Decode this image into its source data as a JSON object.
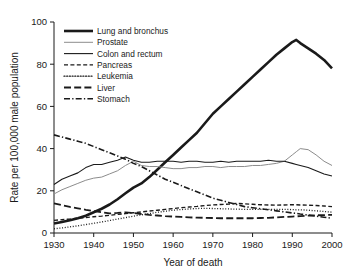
{
  "chart_data": {
    "type": "line",
    "title": "",
    "xlabel": "Year of death",
    "ylabel": "Rate per 100,000 male population",
    "xlim": [
      1930,
      2000
    ],
    "ylim": [
      0,
      100
    ],
    "xticks": [
      1930,
      1940,
      1950,
      1960,
      1970,
      1980,
      1990,
      2000
    ],
    "yticks": [
      0,
      20,
      40,
      60,
      80,
      100
    ],
    "grid": false,
    "legend_position": "upper left",
    "x": [
      1930,
      1932,
      1934,
      1936,
      1938,
      1940,
      1942,
      1944,
      1946,
      1948,
      1950,
      1952,
      1954,
      1956,
      1958,
      1960,
      1962,
      1964,
      1966,
      1968,
      1970,
      1972,
      1974,
      1976,
      1978,
      1980,
      1982,
      1984,
      1986,
      1988,
      1990,
      1991,
      1992,
      1994,
      1996,
      1998,
      2000
    ],
    "series": [
      {
        "name": "Lung and bronchus",
        "style": "solid",
        "width": 2.6,
        "color": "#1a1a1a",
        "values": [
          4.5,
          5.2,
          6.0,
          7.0,
          8.2,
          9.8,
          11.5,
          13.5,
          16.0,
          18.8,
          21.5,
          23.5,
          26.5,
          30.0,
          33.5,
          37.0,
          40.5,
          44.0,
          47.5,
          52.0,
          56.5,
          60.0,
          63.5,
          67.0,
          70.5,
          74.0,
          77.5,
          81.0,
          84.5,
          87.5,
          90.5,
          91.5,
          90.0,
          87.5,
          85.0,
          82.0,
          78.0
        ]
      },
      {
        "name": "Prostate",
        "style": "solid",
        "width": 1.0,
        "color": "#8c8c8c",
        "values": [
          18.5,
          20.5,
          22.0,
          23.5,
          25.0,
          26.0,
          26.5,
          28.0,
          29.5,
          32.0,
          34.0,
          32.0,
          31.5,
          31.5,
          31.0,
          30.5,
          30.5,
          31.0,
          31.0,
          31.5,
          31.5,
          31.0,
          31.5,
          31.5,
          31.5,
          32.0,
          32.0,
          32.5,
          33.0,
          34.0,
          37.0,
          38.5,
          40.0,
          39.5,
          37.0,
          34.0,
          32.0
        ]
      },
      {
        "name": "Colon and rectum",
        "style": "solid",
        "width": 1.1,
        "color": "#1a1a1a",
        "values": [
          23.0,
          25.5,
          27.0,
          28.5,
          31.0,
          32.5,
          32.5,
          33.5,
          34.5,
          36.0,
          34.5,
          33.5,
          33.5,
          34.0,
          34.0,
          34.0,
          33.5,
          34.0,
          34.0,
          33.5,
          33.5,
          34.0,
          33.5,
          34.0,
          34.0,
          34.0,
          34.0,
          34.5,
          34.0,
          34.0,
          33.0,
          32.5,
          32.0,
          31.0,
          29.5,
          28.0,
          27.0
        ]
      },
      {
        "name": "Pancreas",
        "style": "dashed",
        "width": 1.4,
        "color": "#1a1a1a",
        "values": [
          6.0,
          6.3,
          6.6,
          7.0,
          7.3,
          7.7,
          8.0,
          8.4,
          8.8,
          9.2,
          9.6,
          10.0,
          10.4,
          10.8,
          11.2,
          11.6,
          12.0,
          12.3,
          12.6,
          13.0,
          13.3,
          13.5,
          13.7,
          14.0,
          13.8,
          13.6,
          13.4,
          13.3,
          13.2,
          13.3,
          13.4,
          13.4,
          13.3,
          13.2,
          13.0,
          12.8,
          12.5
        ]
      },
      {
        "name": "Leukemia",
        "style": "dotted",
        "width": 1.3,
        "color": "#1a1a1a",
        "values": [
          2.0,
          2.4,
          2.9,
          3.4,
          4.0,
          4.6,
          5.2,
          5.9,
          6.6,
          7.3,
          8.0,
          8.6,
          9.2,
          9.8,
          10.3,
          10.8,
          11.1,
          11.4,
          11.6,
          11.7,
          11.6,
          11.5,
          11.4,
          11.3,
          11.2,
          11.2,
          11.2,
          11.2,
          11.2,
          11.2,
          11.1,
          11.0,
          11.0,
          10.8,
          10.5,
          10.2,
          9.9
        ]
      },
      {
        "name": "Liver",
        "style": "longdash",
        "width": 1.8,
        "color": "#1a1a1a",
        "values": [
          14.0,
          13.2,
          12.4,
          11.7,
          11.0,
          10.4,
          9.8,
          9.3,
          9.5,
          9.8,
          9.5,
          9.0,
          8.6,
          8.3,
          8.0,
          7.8,
          7.6,
          7.4,
          7.3,
          7.2,
          7.1,
          7.0,
          7.0,
          7.0,
          7.0,
          7.0,
          7.1,
          7.2,
          7.4,
          7.6,
          7.8,
          7.9,
          8.0,
          8.2,
          8.4,
          8.5,
          8.6
        ]
      },
      {
        "name": "Stomach",
        "style": "dashdot",
        "width": 1.6,
        "color": "#1a1a1a",
        "values": [
          46.5,
          45.5,
          44.5,
          43.5,
          42.5,
          41.0,
          39.5,
          38.0,
          36.5,
          35.0,
          33.0,
          31.5,
          29.5,
          27.5,
          25.5,
          24.0,
          22.5,
          21.0,
          19.5,
          18.0,
          16.5,
          15.5,
          14.5,
          13.5,
          12.5,
          12.0,
          11.5,
          11.0,
          10.5,
          10.0,
          9.5,
          9.3,
          9.0,
          8.5,
          8.0,
          7.5,
          7.0
        ]
      }
    ]
  }
}
